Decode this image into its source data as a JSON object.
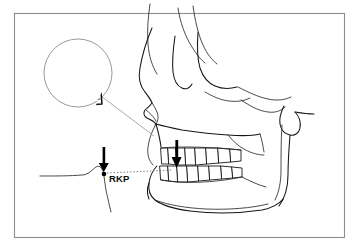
{
  "figure": {
    "type": "line-drawing",
    "canvas": {
      "width": 360,
      "height": 251
    },
    "background_color": "#ffffff",
    "line_color": "#161616",
    "frame": {
      "name": "figure-border",
      "x": 14,
      "y": 13,
      "width": 331,
      "height": 225,
      "stroke_color": "#8d8d8d"
    }
  },
  "labels": [
    {
      "id": "rkp",
      "text": "RKP",
      "x": 104,
      "y": 180,
      "bold": true,
      "color": "#0d0d0d"
    }
  ],
  "annotations": {
    "arrows": [
      {
        "name": "rkp-arrow",
        "description": "downward arrow pointing to RKP reference point",
        "x": 104,
        "y_top": 147,
        "y_tip": 172,
        "color": "#000000"
      },
      {
        "name": "occlusion-arrow",
        "description": "downward arrow pointing to molar occlusal contact",
        "x": 177,
        "y_top": 140,
        "y_tip": 168,
        "color": "#000000"
      }
    ],
    "marker_dot": {
      "name": "rkp-point",
      "x": 104,
      "y": 174,
      "radius": 2.2,
      "color": "#000000"
    },
    "reference_line": {
      "name": "rkp-occlusal-reference",
      "style": "dotted",
      "x1": 106,
      "y1": 173,
      "x2": 172,
      "y2": 170,
      "color": "#5a5a5a"
    }
  },
  "inset": {
    "name": "occlusal-magnifier",
    "description": "Magnified circular inset showing upper cusp seated between two lower cusps",
    "circle": {
      "cx": 78,
      "cy": 73,
      "r": 34
    },
    "circle_stroke": "#9a9a9a",
    "leader_line": {
      "name": "magnifier-leader",
      "x1": 102,
      "y1": 97,
      "x2": 153,
      "y2": 135,
      "color": "#a0a0a0"
    }
  },
  "anatomy": {
    "regions": [
      "cranial-base",
      "frontal-nasal-profile",
      "orbital-outline",
      "anterior-nasal-spine",
      "maxilla",
      "maxillary-teeth",
      "mandibular-teeth",
      "mandible-body",
      "mandibular-ramus",
      "condyle",
      "gonial-angle",
      "soft-tissue-profile"
    ]
  }
}
